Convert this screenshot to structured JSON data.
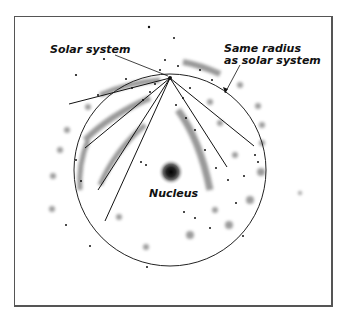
{
  "labels": {
    "solar_system": "Solar system",
    "same_radius_line1": "Same radius",
    "same_radius_line2": "as solar system",
    "nucleus": "Nucleus"
  },
  "colors": {
    "ink": "#111111",
    "haze": "#8a8a8a",
    "frame": "#555555"
  },
  "geometry": {
    "circle": {
      "cx": 170,
      "cy": 170,
      "r": 96
    },
    "solar_system_point": {
      "x": 170,
      "y": 78
    },
    "nucleus": {
      "cx": 171,
      "cy": 172
    }
  }
}
